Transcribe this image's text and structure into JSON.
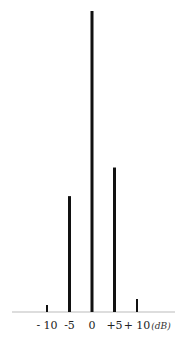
{
  "chart_data": {
    "type": "bar",
    "title": "",
    "xlabel": "(dB)",
    "ylabel": "",
    "categories": [
      "-10",
      "-5",
      "0",
      "+5",
      "+10"
    ],
    "x": [
      -10,
      -5,
      0,
      5,
      10
    ],
    "values": [
      0.023,
      0.385,
      1.0,
      0.48,
      0.043
    ],
    "tick_labels": [
      "- 10",
      "-5",
      "0",
      "+5",
      "+ 10"
    ],
    "unit_label": "(dB)",
    "ylim": [
      0,
      1.0
    ],
    "xlim": [
      -14,
      20
    ],
    "grid": false,
    "legend": "none",
    "bar_color": "#111111"
  }
}
